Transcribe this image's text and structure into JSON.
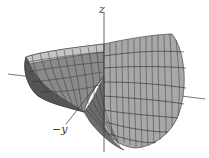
{
  "figure": {
    "type": "3d-surface-plot",
    "colors": {
      "surface_light": "#b8b8b8",
      "surface_mid": "#9a9a9a",
      "surface_dark": "#5e5e5e",
      "mesh": "#2a2a2a",
      "axis": "#444444"
    }
  },
  "axes": {
    "z_label": "z",
    "neg_y_label": "−y"
  }
}
